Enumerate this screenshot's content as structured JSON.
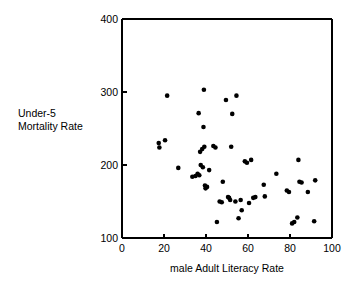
{
  "chart_data": {
    "type": "scatter",
    "title": "",
    "xlabel": "male Adult Literacy Rate",
    "ylabel": "Under-5 Mortality Rate",
    "ylabel_lines": [
      "Under-5",
      "Mortality Rate"
    ],
    "xlim": [
      0,
      100
    ],
    "ylim": [
      100,
      400
    ],
    "xticks": [
      0,
      20,
      40,
      60,
      80,
      100
    ],
    "yticks": [
      100,
      200,
      300,
      400
    ],
    "xtick_labels": [
      "0",
      "20",
      "40",
      "60",
      "80",
      "100"
    ],
    "ytick_labels": [
      "100",
      "200",
      "300",
      "400"
    ],
    "grid": false,
    "legend": false,
    "marker": "filled-circle",
    "marker_color": "#000000",
    "marker_size": 2.3,
    "n_points": 58,
    "points": [
      {
        "x": 17.5,
        "y": 230
      },
      {
        "x": 17.8,
        "y": 224
      },
      {
        "x": 20.5,
        "y": 234
      },
      {
        "x": 21.5,
        "y": 295
      },
      {
        "x": 26.8,
        "y": 196
      },
      {
        "x": 33.5,
        "y": 184
      },
      {
        "x": 36.0,
        "y": 188
      },
      {
        "x": 36.5,
        "y": 271
      },
      {
        "x": 37.2,
        "y": 218
      },
      {
        "x": 37.5,
        "y": 200
      },
      {
        "x": 38.5,
        "y": 197
      },
      {
        "x": 38.8,
        "y": 252
      },
      {
        "x": 39.0,
        "y": 303
      },
      {
        "x": 39.2,
        "y": 225
      },
      {
        "x": 39.5,
        "y": 172
      },
      {
        "x": 39.8,
        "y": 168
      },
      {
        "x": 41.5,
        "y": 193
      },
      {
        "x": 44.5,
        "y": 224
      },
      {
        "x": 45.2,
        "y": 122
      },
      {
        "x": 46.5,
        "y": 150
      },
      {
        "x": 48.0,
        "y": 177
      },
      {
        "x": 49.5,
        "y": 289
      },
      {
        "x": 51.0,
        "y": 155
      },
      {
        "x": 51.5,
        "y": 152
      },
      {
        "x": 52.0,
        "y": 225
      },
      {
        "x": 52.5,
        "y": 270
      },
      {
        "x": 54.0,
        "y": 150
      },
      {
        "x": 54.5,
        "y": 295
      },
      {
        "x": 55.5,
        "y": 127
      },
      {
        "x": 57.0,
        "y": 138
      },
      {
        "x": 59.5,
        "y": 203
      },
      {
        "x": 60.5,
        "y": 148
      },
      {
        "x": 61.5,
        "y": 207
      },
      {
        "x": 63.5,
        "y": 156
      },
      {
        "x": 67.5,
        "y": 173
      },
      {
        "x": 73.5,
        "y": 188
      },
      {
        "x": 79.5,
        "y": 163
      },
      {
        "x": 81.0,
        "y": 120
      },
      {
        "x": 82.0,
        "y": 122
      },
      {
        "x": 83.5,
        "y": 128
      },
      {
        "x": 84.0,
        "y": 207
      },
      {
        "x": 84.5,
        "y": 177
      },
      {
        "x": 88.5,
        "y": 163
      },
      {
        "x": 91.5,
        "y": 123
      },
      {
        "x": 92.0,
        "y": 179
      },
      {
        "x": 38.2,
        "y": 222
      },
      {
        "x": 36.8,
        "y": 186
      },
      {
        "x": 43.5,
        "y": 226
      },
      {
        "x": 50.5,
        "y": 156
      },
      {
        "x": 56.5,
        "y": 152
      },
      {
        "x": 62.5,
        "y": 155
      },
      {
        "x": 58.5,
        "y": 205
      },
      {
        "x": 47.5,
        "y": 149
      },
      {
        "x": 68.0,
        "y": 157
      },
      {
        "x": 78.5,
        "y": 165
      },
      {
        "x": 85.5,
        "y": 176
      },
      {
        "x": 35.0,
        "y": 185
      },
      {
        "x": 40.5,
        "y": 170
      }
    ]
  },
  "axis_labels": {
    "x_title": "male Adult Literacy Rate",
    "y_title_line1": "Under-5",
    "y_title_line2": "Mortality Rate"
  }
}
